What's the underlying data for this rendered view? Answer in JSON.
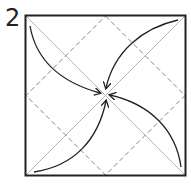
{
  "diagram": {
    "step_number": "2",
    "square": {
      "x": 25,
      "y": 15,
      "size": 161
    },
    "colors": {
      "border": "#222222",
      "diagonal": "#aaaaaa",
      "valley_fold": "#777777",
      "arrow": "#222222"
    },
    "elements": [
      {
        "type": "square-outline",
        "label": "paper square"
      },
      {
        "type": "diagonal-crease",
        "label": "diagonal creases (both)"
      },
      {
        "type": "valley-fold-dashed",
        "label": "dashed diamond fold lines connecting edge midpoints"
      },
      {
        "type": "arrow",
        "from": "top-left corner",
        "to": "center"
      },
      {
        "type": "arrow",
        "from": "top-right corner",
        "to": "center"
      },
      {
        "type": "arrow",
        "from": "bottom-right corner",
        "to": "center"
      },
      {
        "type": "arrow",
        "from": "bottom-left corner",
        "to": "center"
      }
    ],
    "instruction": "Fold all four corners to the center"
  }
}
